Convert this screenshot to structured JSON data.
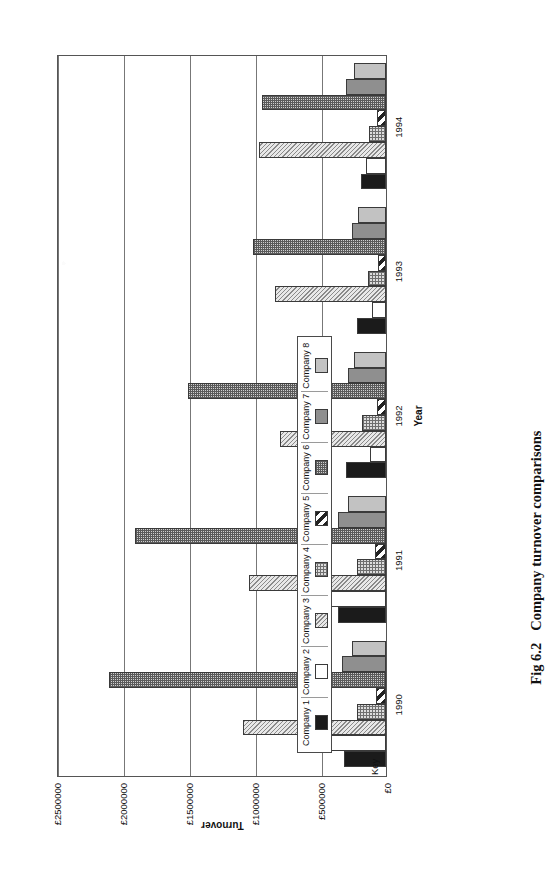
{
  "caption": {
    "figure_number": "Fig 6.2",
    "title": "Company turnover comparisons"
  },
  "legend": {
    "title": "Key",
    "items": [
      {
        "label": "Company 1",
        "pattern": "solid-black"
      },
      {
        "label": "Company 2",
        "pattern": "solid-white"
      },
      {
        "label": "Company 3",
        "pattern": "light-hatch"
      },
      {
        "label": "Company 4",
        "pattern": "fine-grid"
      },
      {
        "label": "Company 5",
        "pattern": "diagonal-stripe"
      },
      {
        "label": "Company 6",
        "pattern": "dense-grid"
      },
      {
        "label": "Company 7",
        "pattern": "solid-dark-gray"
      },
      {
        "label": "Company 8",
        "pattern": "solid-light-gray"
      }
    ]
  },
  "chart_data": {
    "type": "bar",
    "orientation": "horizontal",
    "title": "Company turnover comparisons",
    "xlabel": "Year",
    "ylabel": "Turnover",
    "categories": [
      "1990",
      "1991",
      "1992",
      "1993",
      "1994"
    ],
    "tick_labels": [
      "£0",
      "£500000",
      "£1000000",
      "£1500000",
      "£2000000",
      "£2500000"
    ],
    "tick_values": [
      0,
      500000,
      1000000,
      1500000,
      2000000,
      2500000
    ],
    "ylim": [
      0,
      2500000
    ],
    "grid": true,
    "legend_position": "inside-lower-left",
    "series": [
      {
        "name": "Company 1",
        "pattern": "solid-black",
        "values": [
          320000,
          360000,
          300000,
          220000,
          190000
        ]
      },
      {
        "name": "Company 2",
        "pattern": "solid-white",
        "values": [
          420000,
          440000,
          120000,
          105000,
          150000
        ]
      },
      {
        "name": "Company 3",
        "pattern": "light-hatch",
        "values": [
          1080000,
          1040000,
          800000,
          840000,
          960000
        ]
      },
      {
        "name": "Company 4",
        "pattern": "fine-grid",
        "values": [
          220000,
          220000,
          180000,
          140000,
          130000
        ]
      },
      {
        "name": "Company 5",
        "pattern": "diagonal-stripe",
        "values": [
          75000,
          80000,
          70000,
          60000,
          70000
        ]
      },
      {
        "name": "Company 6",
        "pattern": "dense-grid",
        "values": [
          2095000,
          1900000,
          1500000,
          1010000,
          940000
        ]
      },
      {
        "name": "Company 7",
        "pattern": "solid-dark-gray",
        "values": [
          330000,
          360000,
          290000,
          260000,
          300000
        ]
      },
      {
        "name": "Company 8",
        "pattern": "solid-light-gray",
        "values": [
          260000,
          290000,
          240000,
          210000,
          240000
        ]
      }
    ]
  }
}
